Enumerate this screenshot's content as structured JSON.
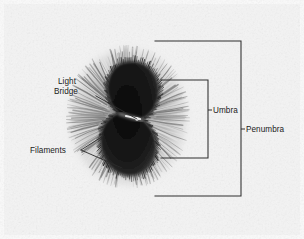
{
  "figure": {
    "background_color": "#f2f2f2",
    "ink_color": "#2f2f2f",
    "umbra_color": "#1a1a1a",
    "penumbra_color": "#9a9a9a",
    "photosphere_color": "#efefef"
  },
  "labels": {
    "light_bridge_line1": "Light",
    "light_bridge_line2": "Bridge",
    "filaments": "Filaments",
    "umbra": "Umbra",
    "penumbra": "Penumbra"
  },
  "annotations": {
    "light_bridge": {
      "text_x": 58,
      "text_y_line1": 84,
      "text_y_line2": 94,
      "leader": "M 96 96 L 137 119"
    },
    "filaments": {
      "text_x": 30,
      "text_y": 153,
      "fork_apex_x": 81,
      "fork_apex_y": 150,
      "upper_branch": "M 81 150 L 103 136",
      "lower_branch": "M 81 150 L 122 168"
    },
    "umbra_bracket": {
      "path": "M 161 80 L 208 80 L 208 158 L 161 158",
      "tick": "M 208 110 L 212 110",
      "text_x": 213,
      "text_y": 113
    },
    "penumbra_bracket": {
      "path": "M 155 41 L 241 41 L 241 196 L 155 196",
      "tick": "M 241 129 L 245 129",
      "text_x": 246,
      "text_y": 132
    }
  },
  "sunspot": {
    "center_x": 128,
    "center_y": 117,
    "penumbra_radius_x": 62,
    "penumbra_radius_y": 72,
    "umbra_label": "dark bilobed core",
    "light_bridge_x": 137,
    "light_bridge_y": 119,
    "filament_count": 260
  }
}
